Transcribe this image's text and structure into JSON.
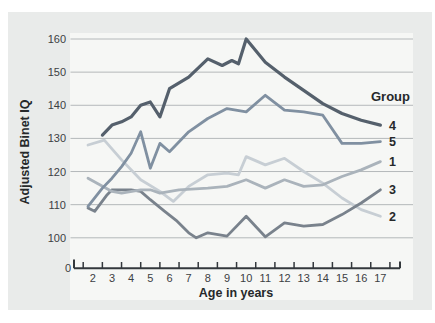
{
  "colors": {
    "page_bg": "#ffffff",
    "panel_bg": "#e9ebea",
    "plot_bg": "#f6f7f5",
    "grid": "#b4b8ba",
    "axis": "#33383c",
    "text": "#26292b",
    "tick_text": "#3c4043"
  },
  "chart_data": {
    "type": "line",
    "title": "",
    "xlabel": "Age in years",
    "ylabel": "Adjusted Binet IQ",
    "origin_label": "0",
    "legend_title": "Group",
    "legend_position": "right",
    "grid": "horizontal",
    "xlim": [
      1.75,
      17
    ],
    "ylim": [
      100,
      160
    ],
    "x_ticks": [
      2,
      3,
      4,
      5,
      6,
      7,
      8,
      9,
      10,
      11,
      12,
      13,
      14,
      15,
      16,
      17
    ],
    "y_ticks": [
      100,
      110,
      120,
      130,
      140,
      150,
      160
    ],
    "series": [
      {
        "label": "4",
        "color": "#55606c",
        "stroke_width": 3.2,
        "points": [
          [
            2.5,
            131
          ],
          [
            3,
            134
          ],
          [
            3.5,
            135
          ],
          [
            4,
            136.5
          ],
          [
            4.5,
            140
          ],
          [
            5,
            141
          ],
          [
            5.5,
            136.5
          ],
          [
            6,
            145
          ],
          [
            7,
            148.5
          ],
          [
            8,
            154
          ],
          [
            8.75,
            152
          ],
          [
            9.25,
            153.5
          ],
          [
            9.6,
            152.5
          ],
          [
            10,
            160
          ],
          [
            11,
            153
          ],
          [
            12,
            148.5
          ],
          [
            13,
            144.5
          ],
          [
            14,
            140.5
          ],
          [
            15,
            137.5
          ],
          [
            16,
            135.5
          ],
          [
            17,
            134
          ]
        ]
      },
      {
        "label": "5",
        "color": "#8090a1",
        "stroke_width": 2.8,
        "points": [
          [
            1.75,
            109.5
          ],
          [
            2.5,
            115
          ],
          [
            3,
            118
          ],
          [
            3.5,
            121.5
          ],
          [
            4,
            125.5
          ],
          [
            4.5,
            132
          ],
          [
            5,
            121
          ],
          [
            5.5,
            128.5
          ],
          [
            6,
            126
          ],
          [
            7,
            132
          ],
          [
            8,
            136
          ],
          [
            9,
            139
          ],
          [
            10,
            138
          ],
          [
            11,
            143
          ],
          [
            12,
            138.5
          ],
          [
            13,
            138
          ],
          [
            14,
            137
          ],
          [
            15,
            128.5
          ],
          [
            16,
            128.5
          ],
          [
            17,
            129
          ]
        ]
      },
      {
        "label": "1",
        "color": "#aab3bb",
        "stroke_width": 2.8,
        "points": [
          [
            1.75,
            118
          ],
          [
            3,
            114
          ],
          [
            3.5,
            113.5
          ],
          [
            4.5,
            114.5
          ],
          [
            5,
            114.5
          ],
          [
            5.5,
            113.5
          ],
          [
            6.5,
            114.5
          ],
          [
            8,
            115
          ],
          [
            9,
            115.5
          ],
          [
            10,
            117.5
          ],
          [
            11,
            115
          ],
          [
            12,
            117.5
          ],
          [
            13,
            115.5
          ],
          [
            14,
            116
          ],
          [
            15,
            118.5
          ],
          [
            16,
            120.5
          ],
          [
            17,
            123
          ]
        ]
      },
      {
        "label": "3",
        "color": "#79828c",
        "stroke_width": 2.8,
        "points": [
          [
            1.75,
            109
          ],
          [
            2.1,
            108
          ],
          [
            2.75,
            113
          ],
          [
            3,
            114.5
          ],
          [
            4,
            114.5
          ],
          [
            4.5,
            114
          ],
          [
            5,
            111.5
          ],
          [
            5.75,
            108
          ],
          [
            6.4,
            105
          ],
          [
            7,
            101.5
          ],
          [
            7.4,
            100
          ],
          [
            8,
            101.5
          ],
          [
            9,
            100.5
          ],
          [
            10,
            106.5
          ],
          [
            11,
            100.3
          ],
          [
            12,
            104.5
          ],
          [
            13,
            103.5
          ],
          [
            14,
            104
          ],
          [
            15,
            107
          ],
          [
            16,
            110.5
          ],
          [
            17,
            114.5
          ]
        ]
      },
      {
        "label": "2",
        "color": "#c7ced4",
        "stroke_width": 2.8,
        "points": [
          [
            1.75,
            128
          ],
          [
            2.6,
            129.5
          ],
          [
            3.5,
            123.5
          ],
          [
            4.5,
            117.5
          ],
          [
            5.5,
            114
          ],
          [
            6.2,
            111
          ],
          [
            7,
            115.5
          ],
          [
            8,
            119
          ],
          [
            9,
            119.5
          ],
          [
            9.6,
            119
          ],
          [
            10,
            124.5
          ],
          [
            11,
            122
          ],
          [
            12,
            124
          ],
          [
            13,
            120
          ],
          [
            14,
            116.5
          ],
          [
            15,
            112
          ],
          [
            16,
            108.5
          ],
          [
            17,
            106.5
          ]
        ]
      }
    ]
  }
}
